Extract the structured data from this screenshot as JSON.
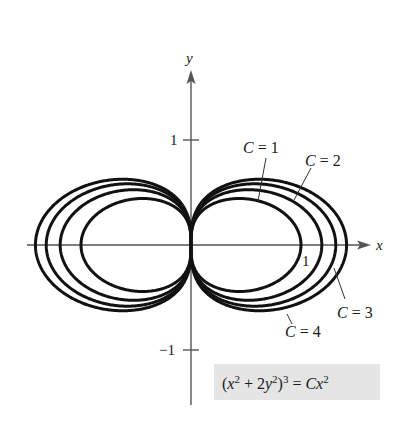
{
  "chart_data": {
    "type": "line",
    "title": "",
    "subtitle": "",
    "equation": "(x^2 + 2y^2)^3 = Cx^2",
    "xlabel": "x",
    "ylabel": "y",
    "x_ticks": [
      1
    ],
    "y_ticks": [
      1,
      -1
    ],
    "xlim": [
      -1.5,
      1.65
    ],
    "ylim": [
      -1.5,
      1.65
    ],
    "grid": false,
    "legend": "inline labels",
    "series": [
      {
        "name": "C = 1",
        "C": 1,
        "x_intercept": 1.0
      },
      {
        "name": "C = 2",
        "C": 2,
        "x_intercept": 1.189
      },
      {
        "name": "C = 3",
        "C": 3,
        "x_intercept": 1.316
      },
      {
        "name": "C = 4",
        "C": 4,
        "x_intercept": 1.414
      }
    ]
  },
  "axes": {
    "x_label": "x",
    "y_label": "y",
    "x_tick_label": "1",
    "y_tick_pos_label": "1",
    "y_tick_neg_label": "−1"
  },
  "labels": {
    "c1": {
      "var": "C",
      "rest": " = 1"
    },
    "c2": {
      "var": "C",
      "rest": " = 2"
    },
    "c3": {
      "var": "C",
      "rest": " = 3"
    },
    "c4": {
      "var": "C",
      "rest": " = 4"
    }
  },
  "equation_box": {
    "fill": "#e5e5e5",
    "open": "(",
    "x1": "x",
    "sup1": "2",
    "plus": " + 2",
    "y": "y",
    "sup2": "2",
    "close": ")",
    "sup3": "3",
    "eq": " = ",
    "C": "C",
    "x2": "x",
    "sup4": "2"
  }
}
